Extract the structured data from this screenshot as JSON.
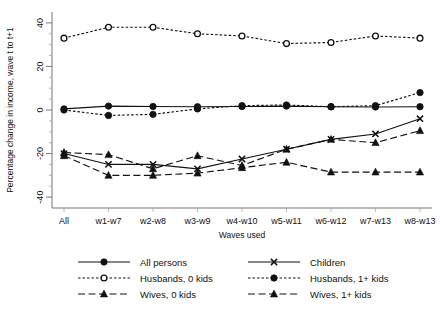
{
  "chart_data": {
    "type": "line",
    "title": "",
    "xlabel": "Waves used",
    "ylabel": "Percentage change in income, wave t to t+1",
    "categories": [
      "All",
      "w1-w7",
      "w2-w8",
      "w3-w9",
      "w4-w10",
      "w5-w11",
      "w6-w12",
      "w7-w13",
      "w8-w13"
    ],
    "ylim": [
      -45,
      45
    ],
    "yticks": [
      -40,
      -20,
      0,
      20,
      40
    ],
    "ytick_labels": [
      "-40",
      "-20",
      "0",
      "20",
      "40"
    ],
    "grid": false,
    "legend_position": "bottom",
    "series": [
      {
        "name": "All persons",
        "marker": "filled-circle",
        "line": "solid",
        "values": [
          0.5,
          1.8,
          1.6,
          1.5,
          1.6,
          1.8,
          1.5,
          1.4,
          1.5
        ]
      },
      {
        "name": "Children",
        "marker": "cross-x",
        "line": "solid",
        "values": [
          -20.0,
          -25.0,
          -25.0,
          -27.0,
          -22.5,
          -18.0,
          -13.5,
          -11.0,
          -4.0
        ]
      },
      {
        "name": "Husbands, 0 kids",
        "marker": "open-circle",
        "line": "fine-dashed",
        "values": [
          33.0,
          38.0,
          38.0,
          35.0,
          34.0,
          30.5,
          31.0,
          34.0,
          33.0
        ]
      },
      {
        "name": "Husbands, 1+ kids",
        "marker": "filled-circle",
        "line": "fine-dashed",
        "values": [
          0.0,
          -2.5,
          -2.0,
          0.5,
          2.0,
          2.3,
          1.5,
          2.0,
          8.0
        ]
      },
      {
        "name": "Wives, 0 kids",
        "marker": "filled-triangle",
        "line": "long-dashed",
        "values": [
          -19.5,
          -20.5,
          -27.0,
          -21.0,
          -25.5,
          -18.0,
          -13.5,
          -15.0,
          -9.5
        ]
      },
      {
        "name": "Wives, 1+ kids",
        "marker": "filled-triangle",
        "line": "long-dashed",
        "values": [
          -21.0,
          -30.0,
          -30.0,
          -29.0,
          -26.5,
          -24.0,
          -28.5,
          -28.5,
          -28.5
        ]
      }
    ]
  },
  "legend": {
    "entries": [
      {
        "label": "All persons"
      },
      {
        "label": "Children"
      },
      {
        "label": "Husbands, 0 kids"
      },
      {
        "label": "Husbands, 1+ kids"
      },
      {
        "label": "Wives, 0 kids"
      },
      {
        "label": "Wives, 1+ kids"
      }
    ]
  }
}
